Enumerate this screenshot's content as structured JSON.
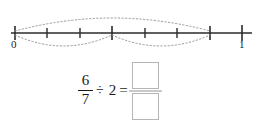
{
  "worksheet": {
    "numberline": {
      "name": "fraction-number-line",
      "start_label": "0",
      "end_label": "1",
      "divisions": 7,
      "tick_count": 8,
      "tick_values": [
        "0",
        "1/7",
        "2/7",
        "3/7",
        "4/7",
        "5/7",
        "6/7",
        "1"
      ],
      "line_color": "#2b2b2b",
      "arc_color": "#9a9a9a",
      "arcs": [
        {
          "name": "arc-above-zero-to-six-sevenths",
          "from_tick": 0,
          "to_tick": 6,
          "position": "above"
        },
        {
          "name": "arc-below-zero-to-three-sevenths",
          "from_tick": 0,
          "to_tick": 3,
          "position": "below"
        },
        {
          "name": "arc-below-three-sevenths-to-six-sevenths",
          "from_tick": 3,
          "to_tick": 6,
          "position": "below"
        }
      ]
    },
    "equation": {
      "dividend_numerator": "6",
      "dividend_denominator": "7",
      "divide_symbol": "÷",
      "divisor": "2",
      "equals_symbol": "=",
      "answer_numerator": "",
      "answer_denominator": "",
      "answer_numerator_placeholder": "",
      "answer_denominator_placeholder": "",
      "box_border_color": "#b5b5b5"
    }
  }
}
